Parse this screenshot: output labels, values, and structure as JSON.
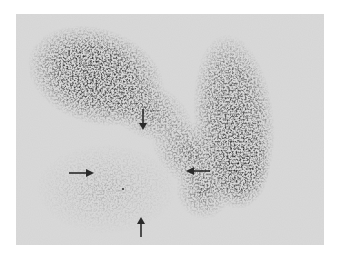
{
  "image": {
    "description": "Grayscale nuclear medicine (scintigraphy) scan showing two dark grainy uptake lobes forming a V/U shape, with a photopenic (light) region at lower-left marked by four arrows",
    "background_color": "#ffffff",
    "scan_bg_color": "#d9d9d9",
    "uptake_color": "#2b2b2b",
    "arrow_color": "#2a2a2a"
  },
  "arrows": [
    {
      "name": "arrow-down",
      "direction": "down",
      "x": 143,
      "y1": 110,
      "y2": 129
    },
    {
      "name": "arrow-right",
      "direction": "right",
      "y": 173,
      "x1": 69,
      "x2": 93
    },
    {
      "name": "arrow-left",
      "direction": "left",
      "y": 171,
      "x1": 208,
      "x2": 186
    },
    {
      "name": "arrow-up",
      "direction": "up",
      "x": 141,
      "y1": 236,
      "y2": 217
    }
  ]
}
